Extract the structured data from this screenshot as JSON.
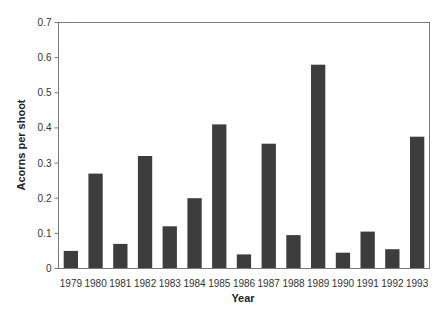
{
  "chart_data": {
    "type": "bar",
    "title": "",
    "xlabel": "Year",
    "ylabel": "Acorns per shoot",
    "ylim": [
      0,
      0.7
    ],
    "yticks": [
      0,
      0.1,
      0.2,
      0.3,
      0.4,
      0.5,
      0.6,
      0.7
    ],
    "ytick_labels": [
      "0",
      "0.1",
      "0.2",
      "0.3",
      "0.4",
      "0.5",
      "0.6",
      "0.7"
    ],
    "grid": false,
    "legend": null,
    "bar_color": "#3d3d3d",
    "categories": [
      "1979",
      "1980",
      "1981",
      "1982",
      "1983",
      "1984",
      "1985",
      "1986",
      "1987",
      "1988",
      "1989",
      "1990",
      "1991",
      "1992",
      "1993"
    ],
    "values": [
      0.05,
      0.27,
      0.07,
      0.32,
      0.12,
      0.2,
      0.41,
      0.04,
      0.355,
      0.095,
      0.58,
      0.045,
      0.105,
      0.055,
      0.375
    ]
  }
}
